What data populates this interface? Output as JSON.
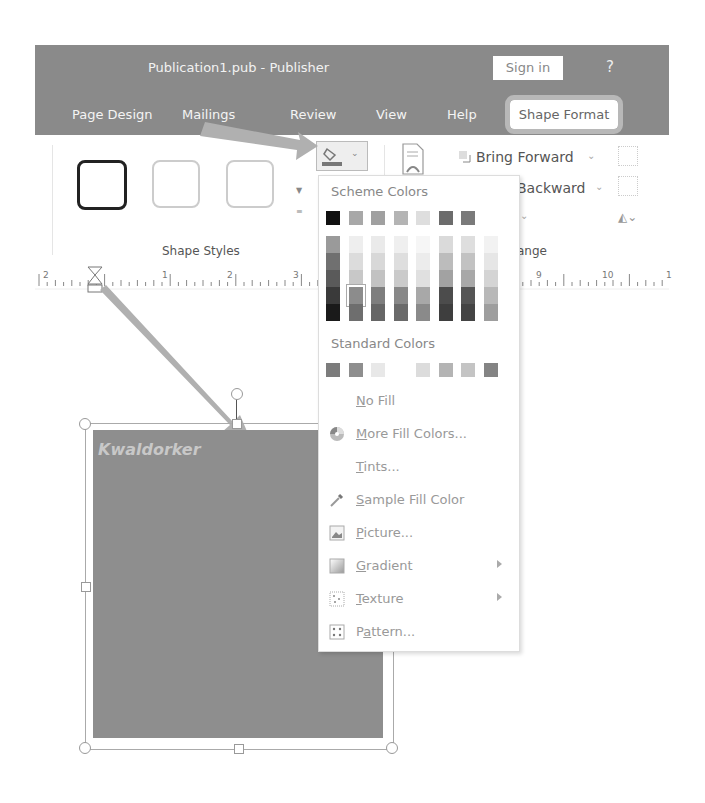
{
  "window": {
    "title": "Publication1.pub  -  Publisher",
    "sign_in": "Sign in",
    "help": "?"
  },
  "tabs": [
    {
      "label": "Page Design"
    },
    {
      "label": "Mailings"
    },
    {
      "label": "Review"
    },
    {
      "label": "View"
    },
    {
      "label": "Help"
    },
    {
      "label": "Shape Format",
      "active": true
    }
  ],
  "ribbon": {
    "shape_styles_label": "Shape Styles",
    "arrange_label": "ange",
    "bring_forward": "Bring Forward",
    "send_backward": "Backward"
  },
  "ruler": {
    "ticks": [
      "2",
      "1",
      "2",
      "3",
      "9",
      "10",
      "1"
    ]
  },
  "fill_menu": {
    "scheme_header": "Scheme Colors",
    "standard_header": "Standard Colors",
    "scheme_top": [
      "#111111",
      "#a8a8a8",
      "#a0a0a0",
      "#b4b4b4",
      "#dedede",
      "#6c6c6c",
      "#7a7a7a"
    ],
    "scheme_columns": [
      [
        "#9a9a9a",
        "#707070",
        "#5a5a5a",
        "#3a3a3a",
        "#1a1a1a"
      ],
      [
        "#eeeeee",
        "#dcdcdc",
        "#c8c8c8",
        "#8c8c8c",
        "#6e6e6e"
      ],
      [
        "#eaeaea",
        "#d8d8d8",
        "#c2c2c2",
        "#7e7e7e",
        "#666666"
      ],
      [
        "#efefef",
        "#dedede",
        "#cacaca",
        "#888888",
        "#6a6a6a"
      ],
      [
        "#f6f6f6",
        "#ececec",
        "#e0e0e0",
        "#a8a8a8",
        "#8a8a8a"
      ],
      [
        "#dadada",
        "#bcbcbc",
        "#a2a2a2",
        "#4c4c4c",
        "#3e3e3e"
      ],
      [
        "#dedede",
        "#c2c2c2",
        "#a8a8a8",
        "#555555",
        "#444444"
      ],
      [
        "#f2f2f2",
        "#e6e6e6",
        "#d4d4d4",
        "#b8b8b8",
        "#9e9e9e"
      ]
    ],
    "standard": [
      "#7c7c7c",
      "#8e8e8e",
      "#e8e8e8",
      "#ffffff",
      "#dcdcdc",
      "#b4b4b4",
      "#c4c4c4",
      "#848484"
    ],
    "items": [
      {
        "label": "No Fill",
        "underline": "N",
        "rest": "o Fill",
        "icon": "none"
      },
      {
        "label": "More Fill Colors...",
        "underline": "M",
        "rest": "ore Fill Colors...",
        "icon": "color-wheel-icon"
      },
      {
        "label": "Tints...",
        "underline": "T",
        "rest": "ints...",
        "icon": "none"
      },
      {
        "label": "Sample Fill Color",
        "underline": "S",
        "rest": "ample Fill Color",
        "icon": "eyedropper-icon"
      },
      {
        "label": "Picture...",
        "underline": "P",
        "rest": "icture...",
        "icon": "picture-icon"
      },
      {
        "label": "Gradient",
        "underline": "G",
        "rest": "radient",
        "icon": "gradient-icon",
        "submenu": true
      },
      {
        "label": "Texture",
        "underline": "T",
        "rest": "exture",
        "icon": "texture-icon",
        "submenu": true
      },
      {
        "label": "Pattern...",
        "pre": "P",
        "underline": "a",
        "rest": "ttern...",
        "icon": "pattern-icon"
      }
    ]
  },
  "canvas": {
    "shape_text": "Kwaldorker",
    "shape_color": "#8e8e8e"
  }
}
